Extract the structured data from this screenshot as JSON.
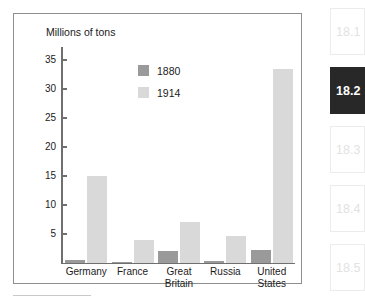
{
  "chart_data": {
    "type": "bar",
    "title": "",
    "ylabel": "Millions of tons",
    "xlabel": "",
    "ylim": [
      0,
      36
    ],
    "yticks": [
      5,
      10,
      15,
      20,
      25,
      30,
      35
    ],
    "grid": false,
    "legend_position": "upper-center",
    "categories": [
      "Germany",
      "France",
      "Great Britain",
      "Russia",
      "United States"
    ],
    "series": [
      {
        "name": "1880",
        "color": "#9a9a9a",
        "values": [
          0.5,
          0.2,
          2.0,
          0.3,
          2.2
        ]
      },
      {
        "name": "1914",
        "color": "#d9d9d9",
        "values": [
          15.0,
          4.0,
          7.1,
          4.6,
          33.4
        ]
      }
    ]
  },
  "figure": {
    "axis_title": "Millions of tons",
    "y_tick_labels": [
      "35",
      "30",
      "25",
      "20",
      "15",
      "10",
      "5"
    ],
    "category_labels": [
      "Germany",
      "France",
      "Great\nBritain",
      "Russia",
      "United\nStates"
    ],
    "legend": [
      {
        "label": "1880",
        "color": "#9a9a9a"
      },
      {
        "label": "1914",
        "color": "#d9d9d9"
      }
    ]
  },
  "section_nav": {
    "items": [
      {
        "label": "18.1",
        "active": false
      },
      {
        "label": "18.2",
        "active": true
      },
      {
        "label": "18.3",
        "active": false
      },
      {
        "label": "18.4",
        "active": false
      },
      {
        "label": "18.5",
        "active": false
      }
    ]
  }
}
